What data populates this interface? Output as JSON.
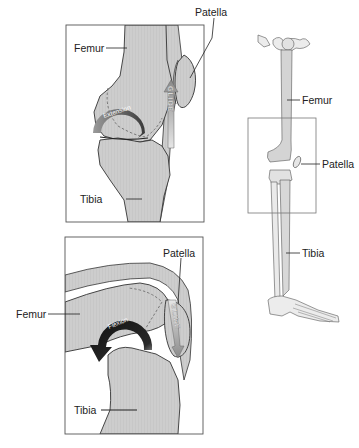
{
  "figure": {
    "type": "anatomical-diagram",
    "colors": {
      "bone_fill": "#cfcfcf",
      "frame_stroke": "#555555",
      "outline": "#333333",
      "arrow_dark": "#1e1e1e",
      "arrow_mid": "#7a7a7a",
      "background": "#ffffff"
    }
  },
  "panels": {
    "extension": {
      "labels": {
        "femur": "Femur",
        "patella": "Patella",
        "tibia": "Tibia"
      },
      "arrows": {
        "rotation": "Extension",
        "glide": "GLIDE"
      },
      "glide_direction": "up"
    },
    "flexion": {
      "labels": {
        "femur": "Femur",
        "patella": "Patella",
        "tibia": "Tibia"
      },
      "arrows": {
        "rotation": "Flexion",
        "glide": "GLIDE"
      },
      "glide_direction": "down"
    },
    "skeleton": {
      "labels": {
        "femur": "Femur",
        "patella": "Patella",
        "tibia": "Tibia"
      },
      "highlight_box": "knee region"
    }
  }
}
